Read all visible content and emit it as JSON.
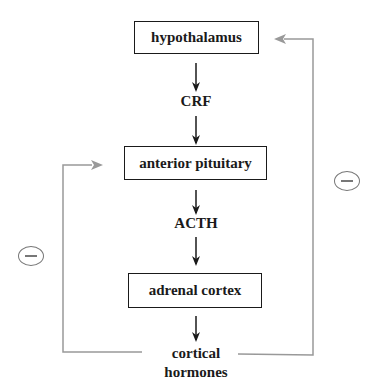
{
  "diagram": {
    "type": "negative feedback loop",
    "nodes": [
      {
        "id": "hypothalamus",
        "label": "hypothalamus",
        "boxed": true
      },
      {
        "id": "crf",
        "label": "CRF",
        "boxed": false
      },
      {
        "id": "anterior_pituitary",
        "label": "anterior pituitary",
        "boxed": true
      },
      {
        "id": "acth",
        "label": "ACTH",
        "boxed": false
      },
      {
        "id": "adrenal_cortex",
        "label": "adrenal cortex",
        "boxed": true
      },
      {
        "id": "cortical_hormones",
        "label_line1": "cortical",
        "label_line2": "hormones",
        "boxed": false
      }
    ],
    "edges": [
      {
        "from": "hypothalamus",
        "to": "crf"
      },
      {
        "from": "crf",
        "to": "anterior_pituitary"
      },
      {
        "from": "anterior_pituitary",
        "to": "acth"
      },
      {
        "from": "acth",
        "to": "adrenal_cortex"
      },
      {
        "from": "adrenal_cortex",
        "to": "cortical_hormones"
      },
      {
        "from": "cortical_hormones",
        "to": "hypothalamus",
        "sign": "minus",
        "style": "feedback"
      },
      {
        "from": "cortical_hormones",
        "to": "anterior_pituitary",
        "sign": "minus",
        "style": "feedback"
      }
    ],
    "feedback_sign": "−",
    "colors": {
      "main": "#1a1a1a",
      "feedback": "#999999",
      "inhibit_circle": "#777777"
    }
  }
}
